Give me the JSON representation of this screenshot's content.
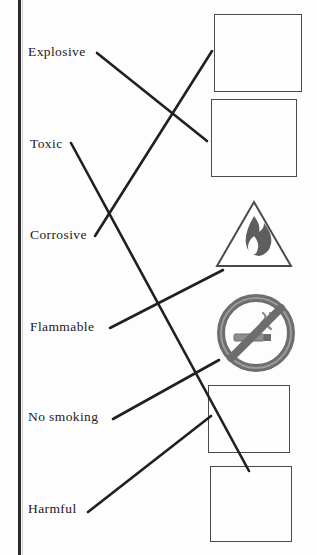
{
  "page": {
    "type": "matching-worksheet",
    "binding_edge": "left"
  },
  "labels": [
    {
      "id": "explosive",
      "text": "Explosive",
      "x": 28,
      "y": 45
    },
    {
      "id": "toxic",
      "text": "Toxic",
      "x": 30,
      "y": 137
    },
    {
      "id": "corrosive",
      "text": "Corrosive",
      "x": 30,
      "y": 228
    },
    {
      "id": "flammable",
      "text": "Flammable",
      "x": 30,
      "y": 320
    },
    {
      "id": "nosmoking",
      "text": "No smoking",
      "x": 28,
      "y": 410
    },
    {
      "id": "harmful",
      "text": "Harmful",
      "x": 28,
      "y": 502
    }
  ],
  "pictograms": [
    {
      "id": "corrosive-icon",
      "name": "corrosive-pictogram",
      "shape": "square",
      "x": 214,
      "y": 14,
      "w": 88,
      "h": 78
    },
    {
      "id": "explosive-icon",
      "name": "explosive-pictogram",
      "shape": "square",
      "x": 211,
      "y": 99,
      "w": 86,
      "h": 78
    },
    {
      "id": "flammable-icon",
      "name": "flammable-pictogram",
      "shape": "triangle",
      "x": 214,
      "y": 198,
      "w": 78,
      "h": 70
    },
    {
      "id": "nosmoking-icon",
      "name": "no-smoking-pictogram",
      "shape": "circle",
      "x": 216,
      "y": 293,
      "w": 78,
      "h": 78
    },
    {
      "id": "harmful-icon",
      "name": "harmful-irritant-pictogram",
      "shape": "square",
      "x": 208,
      "y": 385,
      "w": 82,
      "h": 68
    },
    {
      "id": "toxic-icon",
      "name": "skull-crossbones-pictogram",
      "shape": "square",
      "x": 210,
      "y": 466,
      "w": 82,
      "h": 76
    }
  ],
  "connectors": [
    {
      "from": "explosive",
      "to": "explosive-icon",
      "x1": 97,
      "y1": 53,
      "x2": 207,
      "y2": 141
    },
    {
      "from": "corrosive",
      "to": "corrosive-icon",
      "x1": 95,
      "y1": 236,
      "x2": 212,
      "y2": 51
    },
    {
      "from": "toxic",
      "to": "toxic-icon",
      "x1": 71,
      "y1": 143,
      "x2": 249,
      "y2": 471
    },
    {
      "from": "flammable",
      "to": "flammable-icon",
      "x1": 110,
      "y1": 328,
      "x2": 223,
      "y2": 270
    },
    {
      "from": "nosmoking",
      "to": "nosmoking-icon",
      "x1": 113,
      "y1": 419,
      "x2": 219,
      "y2": 360
    },
    {
      "from": "harmful",
      "to": "harmful-icon",
      "x1": 88,
      "y1": 512,
      "x2": 211,
      "y2": 416
    }
  ],
  "colors": {
    "ink": "#231f1f",
    "line": "#231f1f",
    "pictogram_fill": "#6f6f6f",
    "frame": "#4a4a4a",
    "paper": "#fdfdfd"
  }
}
